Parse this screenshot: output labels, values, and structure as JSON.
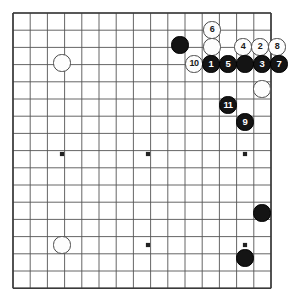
{
  "app": {
    "title": "Go Board Diagram",
    "board_type": "go-board",
    "background_color": "#ffffff",
    "line_color": "#555555",
    "border_color": "#3a3a3a",
    "black_color": "#141414",
    "white_color": "#fdfdfd"
  },
  "board": {
    "origin_x": 13,
    "origin_y": 13,
    "spacing": 17.2,
    "cols": 16,
    "rows": 17,
    "stone_radius": 8.6,
    "star_points": [
      {
        "name": "star-point-left-center",
        "x": 62,
        "y": 154
      },
      {
        "name": "star-point-center",
        "x": 148,
        "y": 154
      },
      {
        "name": "star-point-right-center",
        "x": 245,
        "y": 154
      },
      {
        "name": "star-point-bottom-center",
        "x": 148,
        "y": 245
      },
      {
        "name": "star-point-bottom-right",
        "x": 245,
        "y": 245
      }
    ]
  },
  "stones": [
    {
      "name": "white-stone-upper-left",
      "color": "white",
      "label": "",
      "x": 62,
      "y": 63
    },
    {
      "name": "black-stone-upper-right-plain",
      "color": "black",
      "label": "",
      "x": 180,
      "y": 45
    },
    {
      "name": "white-stone-move-6",
      "color": "white",
      "label": "6",
      "x": 212,
      "y": 30
    },
    {
      "name": "white-stone-upper-plain",
      "color": "white",
      "label": "",
      "x": 212,
      "y": 47
    },
    {
      "name": "white-stone-move-4",
      "color": "white",
      "label": "4",
      "x": 243,
      "y": 47
    },
    {
      "name": "white-stone-move-2",
      "color": "white",
      "label": "2",
      "x": 260,
      "y": 47
    },
    {
      "name": "white-stone-move-8",
      "color": "white",
      "label": "8",
      "x": 277,
      "y": 47
    },
    {
      "name": "white-stone-move-10",
      "color": "white",
      "label": "10",
      "x": 194,
      "y": 64
    },
    {
      "name": "black-stone-move-1",
      "color": "black",
      "label": "1",
      "x": 211,
      "y": 64
    },
    {
      "name": "black-stone-move-5",
      "color": "black",
      "label": "5",
      "x": 228,
      "y": 64
    },
    {
      "name": "black-stone-row-plain",
      "color": "black",
      "label": "",
      "x": 245,
      "y": 64
    },
    {
      "name": "black-stone-move-3",
      "color": "black",
      "label": "3",
      "x": 262,
      "y": 64
    },
    {
      "name": "black-stone-move-7",
      "color": "black",
      "label": "7",
      "x": 279,
      "y": 64
    },
    {
      "name": "white-stone-right-plain",
      "color": "white",
      "label": "",
      "x": 262,
      "y": 89
    },
    {
      "name": "black-stone-move-11",
      "color": "black",
      "label": "11",
      "x": 228,
      "y": 105
    },
    {
      "name": "black-stone-move-9",
      "color": "black",
      "label": "9",
      "x": 245,
      "y": 122
    },
    {
      "name": "black-stone-lower-right-upper",
      "color": "black",
      "label": "",
      "x": 262,
      "y": 213
    },
    {
      "name": "black-stone-lower-right-lower",
      "color": "black",
      "label": "",
      "x": 245,
      "y": 258
    },
    {
      "name": "white-stone-lower-left",
      "color": "white",
      "label": "",
      "x": 62,
      "y": 245
    }
  ]
}
